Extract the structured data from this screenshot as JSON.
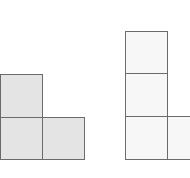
{
  "figure": {
    "shapes": [
      {
        "name": "left-shape",
        "fill": "#e4e4e4",
        "stroke": "#6b6b6b",
        "squares": [
          {
            "x": 0,
            "y": 74,
            "w": 43,
            "h": 44
          },
          {
            "x": 0,
            "y": 117,
            "w": 43,
            "h": 43
          },
          {
            "x": 42,
            "y": 117,
            "w": 43,
            "h": 43
          }
        ]
      },
      {
        "name": "right-shape",
        "fill": "#f7f7f7",
        "stroke": "#6b6b6b",
        "squares": [
          {
            "x": 125,
            "y": 31,
            "w": 43,
            "h": 43
          },
          {
            "x": 125,
            "y": 73,
            "w": 43,
            "h": 44
          },
          {
            "x": 125,
            "y": 116,
            "w": 43,
            "h": 44
          },
          {
            "x": 167,
            "y": 116,
            "w": 43,
            "h": 44
          }
        ]
      }
    ]
  }
}
